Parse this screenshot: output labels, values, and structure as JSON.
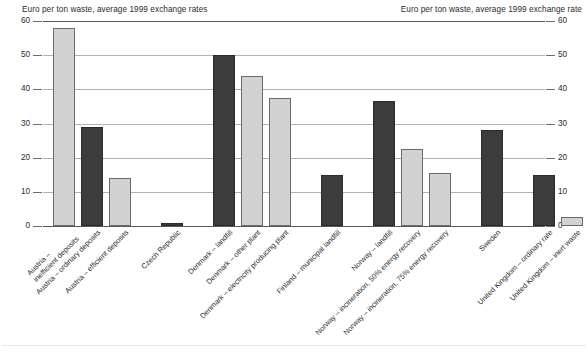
{
  "axes": {
    "left_caption": "Euro per ton waste, average 1999 exchange rates",
    "right_caption": "Euro per ton waste, average 1999 exchange rate",
    "ticks": [
      "60",
      "50",
      "40",
      "30",
      "20",
      "10",
      "0"
    ]
  },
  "chart_data": {
    "type": "bar",
    "title": "",
    "subtitle": "",
    "xlabel": "",
    "ylabel": "Euro per ton waste, average 1999 exchange rates",
    "ylabel_right": "Euro per ton waste, average 1999 exchange rate",
    "ylim": [
      0,
      60
    ],
    "ytick_step": 10,
    "yticks": [
      0,
      10,
      20,
      30,
      40,
      50,
      60
    ],
    "grid": true,
    "legend": "none",
    "categories": [
      "Austria – inefficient deposits",
      "Austria – ordinary deposits",
      "Austria – efficient deposits",
      "Czech Republic",
      "Denmark – landfill",
      "Denmark – other plant",
      "Denmark – electricity producing plant",
      "Finland – municipal landfill",
      "Norway – landfill",
      "Norway – incineration, 50% energy recovery",
      "Norway – incineration, 75% energy recovery",
      "Sweden",
      "United Kingdom – ordinary rate",
      "United Kingdom – inert waste"
    ],
    "values": [
      58,
      29,
      14,
      0.8,
      50,
      44,
      37.5,
      15,
      36.5,
      22.5,
      15.5,
      28,
      15,
      2.5
    ],
    "shades": [
      "light",
      "dark",
      "light",
      "dark",
      "dark",
      "light",
      "light",
      "dark",
      "dark",
      "light",
      "light",
      "dark",
      "dark",
      "light"
    ],
    "colors": {
      "light_bar": "#d2d2d2",
      "dark_bar": "#3c3c3c",
      "bar_outline": "#6b6b6b",
      "gridline": "#b4b4b4",
      "axis_rule": "#5a5a5a",
      "text": "#2b2b2b"
    },
    "label_lines": [
      [
        "Austria –",
        "inefficient deposits"
      ],
      [
        "Austria – ordinary deposits",
        ""
      ],
      [
        "Austria – efficient deposits",
        ""
      ],
      [
        "Czech Republic",
        ""
      ],
      [
        "Denmark – landfill",
        ""
      ],
      [
        "Denmark – other plant",
        ""
      ],
      [
        "Denmark – electricity producing plant",
        ""
      ],
      [
        "Finland – municipal landfill",
        ""
      ],
      [
        "Norway – landfill",
        ""
      ],
      [
        "Norway – incineration, 50% energy recovery",
        ""
      ],
      [
        "Norway – incineration, 75% energy recovery",
        ""
      ],
      [
        "Sweden",
        ""
      ],
      [
        "United Kingdom – ordinary rate",
        ""
      ],
      [
        "United Kingdom – inert waste",
        ""
      ]
    ]
  }
}
